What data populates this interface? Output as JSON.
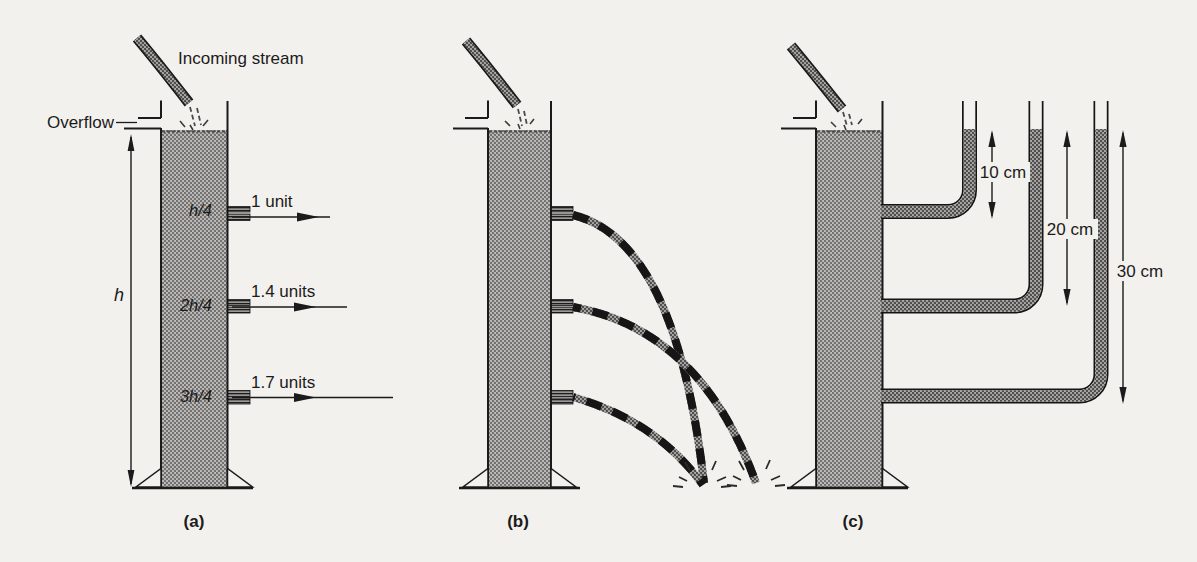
{
  "title_labels": {
    "incoming_stream": "Incoming stream",
    "overflow": "Overflow",
    "tank_height": "h"
  },
  "tank_a": {
    "caption": "(a)",
    "outlets": [
      {
        "depth_label": "h/4",
        "flow_label": "1 unit"
      },
      {
        "depth_label": "2h/4",
        "flow_label": "1.4 units"
      },
      {
        "depth_label": "3h/4",
        "flow_label": "1.7 units"
      }
    ]
  },
  "tank_b": {
    "caption": "(b)"
  },
  "tank_c": {
    "caption": "(c)",
    "pipe_heights": [
      {
        "label": "10 cm"
      },
      {
        "label": "20 cm"
      },
      {
        "label": "30 cm"
      }
    ]
  },
  "colors": {
    "paper": "#f3f1ed",
    "ink": "#1b1b1b",
    "water_gray": "#a2a09d"
  }
}
